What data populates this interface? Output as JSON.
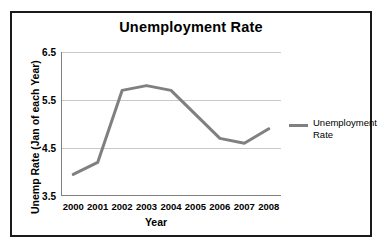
{
  "chart_data": {
    "type": "line",
    "title": "Unemployment Rate",
    "xlabel": "Year",
    "ylabel": "Unemp Rate (Jan of each Year)",
    "categories": [
      "2000",
      "2001",
      "2002",
      "2003",
      "2004",
      "2005",
      "2006",
      "2007",
      "2008"
    ],
    "series": [
      {
        "name": "Unemployment Rate",
        "values": [
          3.95,
          4.2,
          5.7,
          5.8,
          5.7,
          5.2,
          4.7,
          4.6,
          4.9
        ],
        "color": "#808080"
      }
    ],
    "ylim": [
      3.5,
      6.5
    ],
    "yticks": [
      3.5,
      4.5,
      5.5,
      6.5
    ],
    "ytick_labels": [
      "3.5",
      "4.5",
      "5.5",
      "6.5"
    ],
    "grid": true,
    "grid_color": "#c8c8c8",
    "axis_color": "#808080",
    "legend_position": "right",
    "legend_entries": [
      "Unemployment Rate"
    ],
    "border_color": "#1a1a1a",
    "background": "#ffffff"
  }
}
